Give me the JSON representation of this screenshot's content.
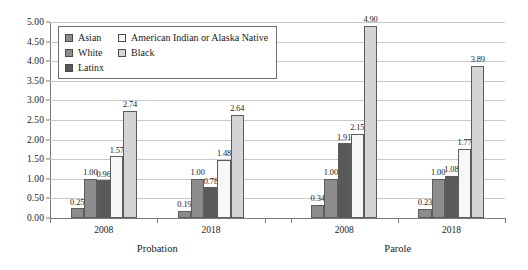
{
  "chart_data": {
    "type": "bar",
    "title": "",
    "subtitle": "",
    "xlabel": "",
    "ylabel": "",
    "ylim": [
      0,
      5
    ],
    "ytick_step": 0.5,
    "ytick_labels": [
      "0.00",
      "0.50",
      "1.00",
      "1.50",
      "2.00",
      "2.50",
      "3.00",
      "3.50",
      "4.00",
      "4.50",
      "5.00"
    ],
    "grid": true,
    "legend_position": "top-left",
    "panels": [
      "Probation",
      "Parole"
    ],
    "categories": [
      "2008",
      "2018",
      "2008",
      "2018"
    ],
    "group_labels": [
      "2008",
      "2018",
      "2008",
      "2018"
    ],
    "series": [
      {
        "name": "Asian",
        "color": "#8c8c8c",
        "values": [
          0.25,
          0.19,
          0.34,
          0.23
        ],
        "labels": [
          "0.25",
          "0.19",
          "0.34",
          "0.23"
        ]
      },
      {
        "name": "White",
        "color": "#8c8c8c",
        "values": [
          1.0,
          1.0,
          1.0,
          1.0
        ],
        "labels": [
          "1.00",
          "1.00",
          "1.00",
          "1.00"
        ]
      },
      {
        "name": "Latinx",
        "color": "#595959",
        "values": [
          0.96,
          0.78,
          1.91,
          1.08
        ],
        "labels": [
          "0.96",
          "0.78",
          "1.91",
          "1.08"
        ]
      },
      {
        "name": "American Indian or Alaska Native",
        "color": "#f7f7f7",
        "values": [
          1.57,
          1.48,
          2.15,
          1.77
        ],
        "labels": [
          "1.57",
          "1.48",
          "2.15",
          "1.77"
        ]
      },
      {
        "name": "Black",
        "color": "#d4d4d4",
        "values": [
          2.74,
          2.64,
          4.9,
          3.89
        ],
        "labels": [
          "2.74",
          "2.64",
          "4.90",
          "3.89"
        ]
      }
    ]
  },
  "legend": {
    "columns": [
      [
        "Asian",
        "White",
        "Latinx"
      ],
      [
        "American Indian or Alaska Native",
        "Black"
      ]
    ]
  },
  "colors": {
    "asian": "#8c8c8c",
    "white": "#8c8c8c",
    "latinx": "#595959",
    "american_indian_or_alaska_native": "#f7f7f7",
    "black": "#d4d4d4",
    "gridline": "#c9c9c9",
    "axis": "#7a7a7a",
    "bar_border": "#5c5c5c",
    "text": "#1a1a1a",
    "background": "#ffffff"
  }
}
